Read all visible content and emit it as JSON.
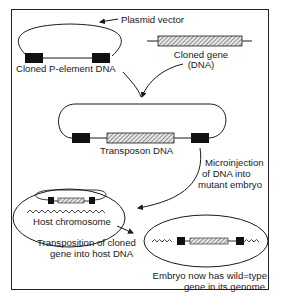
{
  "diagram": {
    "labels": {
      "plasmid_vector": "Plasmid vector",
      "cloned_p_element": "Cloned P-element DNA",
      "cloned_gene_line1": "Cloned gene",
      "cloned_gene_line2": "(DNA)",
      "transposon": "Transposon DNA",
      "microinjection_line1": "Microinjection",
      "microinjection_line2": "of DNA into",
      "microinjection_line3": "mutant embryo",
      "host_chromosome": "Host chromosome",
      "transposition_line1": "Transposition of cloned",
      "transposition_line2": "gene into host DNA",
      "embryo_line1": "Embryo now has wild=type",
      "embryo_line2": "gene in its genome"
    },
    "colors": {
      "line": "#1a1a1a",
      "p_element_block": "#111111",
      "gene_hatch": "#555555",
      "background": "#ffffff"
    }
  }
}
